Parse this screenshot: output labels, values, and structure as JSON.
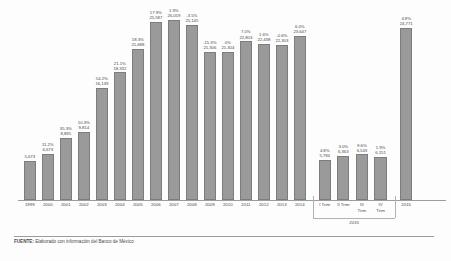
{
  "footer": {
    "source_label": "FUENTE:",
    "source_text": "Elaborado con información del Banco de México"
  },
  "axis": {
    "group_label_2015": "2015"
  },
  "chart_data": {
    "type": "bar",
    "title": "",
    "xlabel": "",
    "ylabel": "",
    "ylim": [
      0,
      27000
    ],
    "grid": false,
    "legend": "none",
    "categories": [
      "1999",
      "2000",
      "2001",
      "2002",
      "2003",
      "2004",
      "2005",
      "2006",
      "2007",
      "2008",
      "2009",
      "2010",
      "2011",
      "2012",
      "2013",
      "2014",
      "I Trim",
      "II Trim",
      "III Trim",
      "IV Trim",
      "2015"
    ],
    "values": [
      5673,
      6673,
      8895,
      9814,
      16139,
      18332,
      21688,
      25587,
      26059,
      25145,
      21306,
      21304,
      22803,
      22438,
      22303,
      23647,
      5794,
      6363,
      6543,
      6151,
      24771
    ],
    "value_labels": [
      "5,673",
      "6,673",
      "8,895",
      "9,814",
      "16,139",
      "18,332",
      "21,688",
      "25,587",
      "26,059",
      "25,145",
      "21,306",
      "21,304",
      "22,803",
      "22,438",
      "22,303",
      "23,647",
      "5,794",
      "6,363",
      "6,543",
      "6,151",
      "24,771"
    ],
    "growth_labels": [
      "",
      "11.2%",
      "35.3%",
      "10.3%",
      "54.2%",
      "21.1%",
      "18.3%",
      "17.9%",
      "1.9%",
      "-3.5%",
      "-15.3%",
      "0%",
      "7.0%",
      "1.6%",
      "-0.6%",
      "6.0%",
      "4.8%",
      "3.0%",
      "9.6%",
      "1.9%",
      "4.8%"
    ],
    "bars": [
      {
        "category": "1999",
        "value": 5673,
        "value_label": "5,673",
        "growth_label": "",
        "group": "annual"
      },
      {
        "category": "2000",
        "value": 6673,
        "value_label": "6,673",
        "growth_label": "11.2%",
        "group": "annual"
      },
      {
        "category": "2001",
        "value": 8895,
        "value_label": "8,895",
        "growth_label": "35.3%",
        "group": "annual"
      },
      {
        "category": "2002",
        "value": 9814,
        "value_label": "9,814",
        "growth_label": "10.3%",
        "group": "annual"
      },
      {
        "category": "2003",
        "value": 16139,
        "value_label": "16,139",
        "growth_label": "54.2%",
        "group": "annual"
      },
      {
        "category": "2004",
        "value": 18332,
        "value_label": "18,332",
        "growth_label": "21.1%",
        "group": "annual"
      },
      {
        "category": "2005",
        "value": 21688,
        "value_label": "21,688",
        "growth_label": "18.3%",
        "group": "annual"
      },
      {
        "category": "2006",
        "value": 25587,
        "value_label": "25,587",
        "growth_label": "17.9%",
        "group": "annual"
      },
      {
        "category": "2007",
        "value": 26059,
        "value_label": "26,059",
        "growth_label": "1.9%",
        "group": "annual"
      },
      {
        "category": "2008",
        "value": 25145,
        "value_label": "25,145",
        "growth_label": "-3.5%",
        "group": "annual"
      },
      {
        "category": "2009",
        "value": 21306,
        "value_label": "21,306",
        "growth_label": "-15.3%",
        "group": "annual"
      },
      {
        "category": "2010",
        "value": 21304,
        "value_label": "21,304",
        "growth_label": "0%",
        "group": "annual"
      },
      {
        "category": "2011",
        "value": 22803,
        "value_label": "22,803",
        "growth_label": "7.0%",
        "group": "annual"
      },
      {
        "category": "2012",
        "value": 22438,
        "value_label": "22,438",
        "growth_label": "1.6%",
        "group": "annual"
      },
      {
        "category": "2013",
        "value": 22303,
        "value_label": "22,303",
        "growth_label": "-0.6%",
        "group": "annual"
      },
      {
        "category": "2014",
        "value": 23647,
        "value_label": "23,647",
        "growth_label": "6.0%",
        "group": "annual"
      },
      {
        "category": "I Trim",
        "value": 5794,
        "value_label": "5,794",
        "growth_label": "4.8%",
        "group": "2015q"
      },
      {
        "category": "II Trim",
        "value": 6363,
        "value_label": "6,363",
        "growth_label": "3.0%",
        "group": "2015q"
      },
      {
        "category": "III Trim",
        "value": 6543,
        "value_label": "6,543",
        "growth_label": "9.6%",
        "group": "2015q"
      },
      {
        "category": "IV Trim",
        "value": 6151,
        "value_label": "6,151",
        "growth_label": "1.9%",
        "group": "2015q"
      },
      {
        "category": "2015",
        "value": 24771,
        "value_label": "24,771",
        "growth_label": "4.8%",
        "group": "annual"
      }
    ],
    "colors": {
      "bar_fill": "#9a9a9a",
      "bar_stroke": "#7d7d7d",
      "text": "#4a4a4a",
      "axis": "#9c9c9c",
      "background": "#fdfdfd"
    }
  }
}
